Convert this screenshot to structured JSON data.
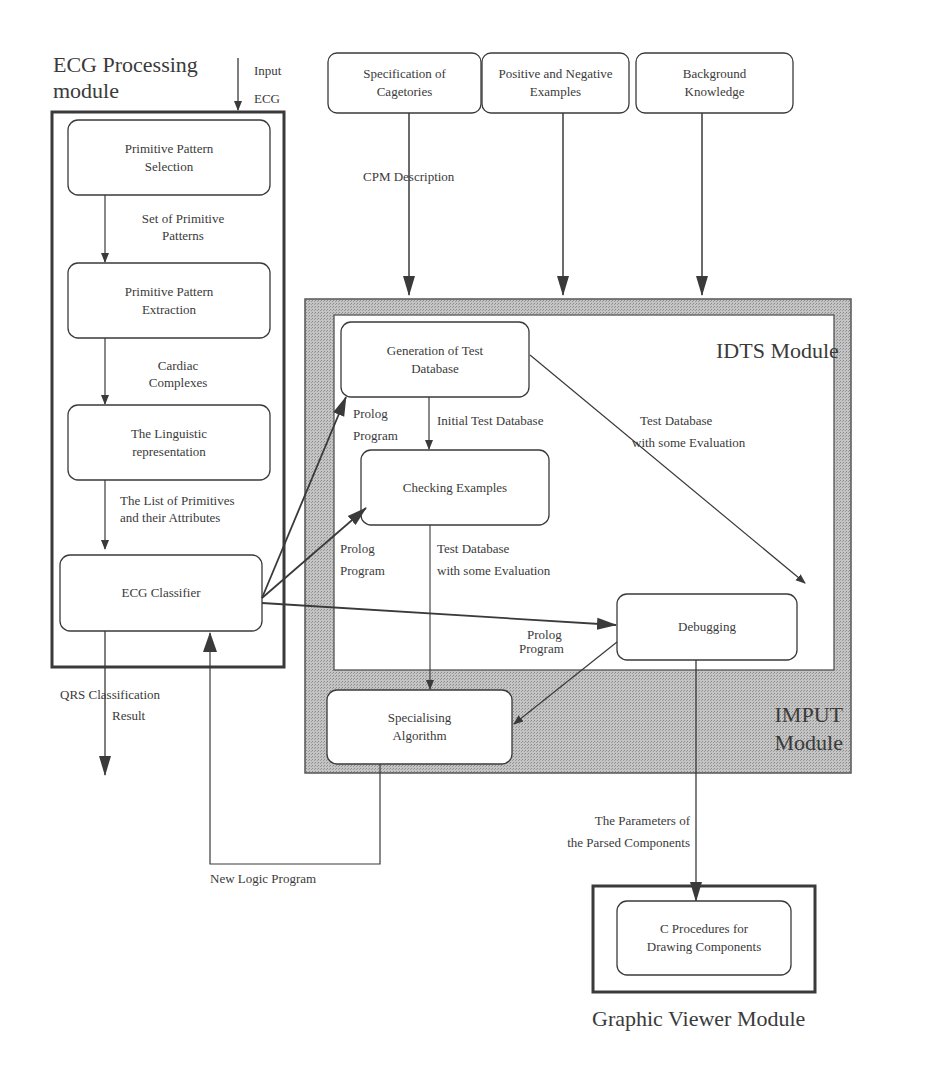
{
  "ecg_module": {
    "title_line1": "ECG Processing",
    "title_line2": "module",
    "input_label_1": "Input",
    "input_label_2": "ECG",
    "boxes": [
      {
        "line1": "Primitive Pattern",
        "line2": "Selection"
      },
      {
        "line1": "Primitive Pattern",
        "line2": "Extraction"
      },
      {
        "line1": "The Linguistic",
        "line2": "representation"
      },
      {
        "line1": "ECG Classifier",
        "line2": ""
      }
    ],
    "edges": [
      {
        "line1": "Set of Primitive",
        "line2": "Patterns"
      },
      {
        "line1": "Cardiac",
        "line2": "Complexes"
      },
      {
        "line1": "The List of Primitives",
        "line2": "and their Attributes"
      }
    ],
    "output_label_1": "QRS  Classification",
    "output_label_2": "Result"
  },
  "inputs": [
    {
      "line1": "Specification of",
      "line2": "Cagetories"
    },
    {
      "line1": "Positive and Negative",
      "line2": "Examples"
    },
    {
      "line1": "Background",
      "line2": "Knowledge"
    }
  ],
  "cpm_label": "CPM  Description",
  "idts_module": {
    "title": "IDTS Module",
    "boxes": {
      "generation": {
        "line1": "Generation of Test",
        "line2": "Database"
      },
      "checking": {
        "line1": "Checking Examples"
      },
      "debugging": {
        "line1": "Debugging"
      }
    },
    "edges": {
      "initial_db": "Initial Test Database",
      "eval_right_1": "Test Database",
      "eval_right_2": "with some Evaluation",
      "eval_mid_1": "Test Database",
      "eval_mid_2": "with some Evaluation",
      "prolog_a_1": "Prolog",
      "prolog_a_2": "Program",
      "prolog_b_1": "Prolog",
      "prolog_b_2": "Program",
      "prolog_c_1": "Prolog",
      "prolog_c_2": "Program"
    }
  },
  "imput_module": {
    "title_line1": "IMPUT",
    "title_line2": "Module",
    "box": {
      "line1": "Specialising",
      "line2": "Algorithm"
    }
  },
  "feedback_label": "New Logic Program",
  "params_label_1": "The Parameters of",
  "params_label_2": "the Parsed Components",
  "graphic_viewer": {
    "title": "Graphic Viewer Module",
    "box": {
      "line1": "C Procedures for",
      "line2": "Drawing Components"
    }
  },
  "colors": {
    "line": "#3a3a3a",
    "imput_fill": "#b9b9b9",
    "box_fill": "#ffffff"
  }
}
